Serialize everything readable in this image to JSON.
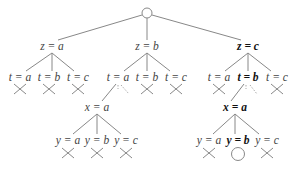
{
  "colors": {
    "line": "#888888",
    "text": "#444444",
    "bold_text": "#111111"
  },
  "root": {
    "x": 147,
    "y": 13,
    "r": 5,
    "icon": "circle-icon"
  },
  "nodes": [
    {
      "id": "z_a",
      "label": "z = a",
      "x": 52,
      "y": 47,
      "bold": false
    },
    {
      "id": "z_b",
      "label": "z = b",
      "x": 147,
      "y": 47,
      "bold": false
    },
    {
      "id": "z_c",
      "label": "z = c",
      "x": 248,
      "y": 47,
      "bold": true
    },
    {
      "id": "z_a_t_a",
      "label": "t = a",
      "x": 20,
      "y": 78,
      "bold": false
    },
    {
      "id": "z_a_t_b",
      "label": "t = b",
      "x": 49,
      "y": 78,
      "bold": false
    },
    {
      "id": "z_a_t_c",
      "label": "t = c",
      "x": 78,
      "y": 78,
      "bold": false
    },
    {
      "id": "z_b_t_a",
      "label": "t = a",
      "x": 118,
      "y": 78,
      "bold": false
    },
    {
      "id": "z_b_t_b",
      "label": "t = b",
      "x": 147,
      "y": 78,
      "bold": false
    },
    {
      "id": "z_b_t_c",
      "label": "t = c",
      "x": 176,
      "y": 78,
      "bold": false
    },
    {
      "id": "z_c_t_a",
      "label": "t = a",
      "x": 219,
      "y": 78,
      "bold": false
    },
    {
      "id": "z_c_t_b",
      "label": "t = b",
      "x": 248,
      "y": 78,
      "bold": true
    },
    {
      "id": "z_c_t_c",
      "label": "t = c",
      "x": 277,
      "y": 78,
      "bold": false
    },
    {
      "id": "mid_x_a",
      "label": "x = a",
      "x": 97,
      "y": 108,
      "bold": false
    },
    {
      "id": "right_x_a",
      "label": "x = a",
      "x": 235,
      "y": 108,
      "bold": true
    },
    {
      "id": "mid_y_a",
      "label": "y = a",
      "x": 68,
      "y": 141,
      "bold": false
    },
    {
      "id": "mid_y_b",
      "label": "y = b",
      "x": 97,
      "y": 141,
      "bold": false
    },
    {
      "id": "mid_y_c",
      "label": "y = c",
      "x": 126,
      "y": 141,
      "bold": false
    },
    {
      "id": "right_y_a",
      "label": "y = a",
      "x": 209,
      "y": 141,
      "bold": false
    },
    {
      "id": "right_y_b",
      "label": "y = b",
      "x": 238,
      "y": 141,
      "bold": true
    },
    {
      "id": "right_y_c",
      "label": "y = c",
      "x": 267,
      "y": 141,
      "bold": false
    }
  ],
  "edges": [
    {
      "x1": 142,
      "y1": 15,
      "x2": 58,
      "y2": 40
    },
    {
      "x1": 147,
      "y1": 18,
      "x2": 147,
      "y2": 40
    },
    {
      "x1": 152,
      "y1": 15,
      "x2": 241,
      "y2": 40
    },
    {
      "x1": 52,
      "y1": 53,
      "x2": 26,
      "y2": 71
    },
    {
      "x1": 52,
      "y1": 53,
      "x2": 52,
      "y2": 71
    },
    {
      "x1": 52,
      "y1": 53,
      "x2": 74,
      "y2": 71
    },
    {
      "x1": 147,
      "y1": 53,
      "x2": 124,
      "y2": 71
    },
    {
      "x1": 147,
      "y1": 53,
      "x2": 147,
      "y2": 71
    },
    {
      "x1": 147,
      "y1": 53,
      "x2": 170,
      "y2": 71
    },
    {
      "x1": 248,
      "y1": 53,
      "x2": 225,
      "y2": 71
    },
    {
      "x1": 248,
      "y1": 53,
      "x2": 248,
      "y2": 71
    },
    {
      "x1": 248,
      "y1": 53,
      "x2": 271,
      "y2": 71
    },
    {
      "x1": 116,
      "y1": 84,
      "x2": 102,
      "y2": 101
    },
    {
      "x1": 244,
      "y1": 84,
      "x2": 231,
      "y2": 101
    },
    {
      "x1": 97,
      "y1": 114,
      "x2": 73,
      "y2": 134
    },
    {
      "x1": 97,
      "y1": 114,
      "x2": 97,
      "y2": 134
    },
    {
      "x1": 97,
      "y1": 114,
      "x2": 121,
      "y2": 134
    },
    {
      "x1": 235,
      "y1": 114,
      "x2": 213,
      "y2": 134
    },
    {
      "x1": 235,
      "y1": 114,
      "x2": 235,
      "y2": 134
    },
    {
      "x1": 235,
      "y1": 114,
      "x2": 259,
      "y2": 134
    }
  ],
  "dashed_edges": [
    {
      "x1": 118,
      "y1": 85,
      "x2": 118,
      "y2": 89
    },
    {
      "x1": 121,
      "y1": 85,
      "x2": 129,
      "y2": 94
    },
    {
      "x1": 246,
      "y1": 85,
      "x2": 246,
      "y2": 89
    },
    {
      "x1": 250,
      "y1": 85,
      "x2": 257,
      "y2": 94
    }
  ],
  "leaf_marks": [
    {
      "type": "cross",
      "x": 20,
      "y": 89
    },
    {
      "type": "cross",
      "x": 49,
      "y": 89
    },
    {
      "type": "cross",
      "x": 78,
      "y": 89
    },
    {
      "type": "cross",
      "x": 147,
      "y": 89
    },
    {
      "type": "cross",
      "x": 176,
      "y": 89
    },
    {
      "type": "cross",
      "x": 219,
      "y": 89
    },
    {
      "type": "cross",
      "x": 277,
      "y": 89
    },
    {
      "type": "cross",
      "x": 68,
      "y": 153
    },
    {
      "type": "cross",
      "x": 97,
      "y": 153
    },
    {
      "type": "cross",
      "x": 126,
      "y": 153
    },
    {
      "type": "cross",
      "x": 209,
      "y": 153
    },
    {
      "type": "circle",
      "x": 238,
      "y": 153
    },
    {
      "type": "cross",
      "x": 267,
      "y": 153
    }
  ]
}
